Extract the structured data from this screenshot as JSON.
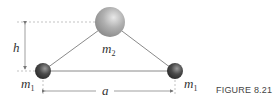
{
  "diagram": {
    "labels": {
      "h": "h",
      "a": "a",
      "m2": "m",
      "m2_sub": "2",
      "m1_left": "m",
      "m1_left_sub": "1",
      "m1_right": "m",
      "m1_right_sub": "1"
    },
    "caption": "FIGURE 8.21",
    "colors": {
      "large_sphere": "#a8a8a8",
      "small_sphere": "#4a4a4a",
      "rod": "#8a8a8a",
      "dimension_line": "#999999"
    }
  }
}
